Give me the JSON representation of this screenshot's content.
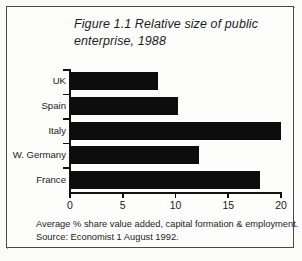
{
  "figure": {
    "title": "Figure 1.1 Relative size of public enterprise, 1988",
    "caption_line_1": "Average % share value added, capital formation & employment.",
    "caption_line_2": "Source: Economist 1 August 1992."
  },
  "chart_data": {
    "type": "bar",
    "orientation": "horizontal",
    "title": "Figure 1.1 Relative size of public enterprise, 1988",
    "categories": [
      "UK",
      "Spain",
      "Italy",
      "W. Germany",
      "France"
    ],
    "values": [
      8.3,
      10.2,
      20.0,
      12.2,
      18.0
    ],
    "xlabel": "",
    "ylabel": "",
    "xlim": [
      0,
      20
    ],
    "xticks": [
      "0",
      "5",
      "10",
      "15",
      "20"
    ],
    "xtick_values": [
      0,
      5,
      10,
      15,
      20
    ],
    "grid": false,
    "legend": false,
    "bar_color": "#0d0d0d",
    "axis_color": "#111111",
    "background": "#fdfdfc"
  }
}
